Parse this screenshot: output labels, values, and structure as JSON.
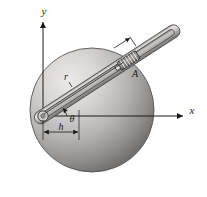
{
  "figure": {
    "background_color": "#ffffff",
    "line_color": "#1a1a1a"
  },
  "axes": {
    "y_label": "y",
    "x_label": "x",
    "origin_x": 43,
    "origin_y": 116,
    "y_tip_x": 43,
    "y_tip_y": 18,
    "x_tip_x": 187,
    "x_tip_y": 116
  },
  "disk": {
    "name": "shaded-disk",
    "center_x": 92,
    "center_y": 110,
    "radius": 62,
    "fill_light": "#e3e2e0",
    "fill_mid": "#b9b8b6",
    "fill_dark": "#6e6d6b",
    "edge_color": "#5a5a58"
  },
  "rod": {
    "name": "slotted-rod",
    "pivot_x": 43,
    "pivot_y": 116,
    "tip_x": 176,
    "tip_y": 30,
    "angle_deg": 33,
    "half_width": 6,
    "body_light": "#dedddb",
    "body_mid": "#b4b3b1",
    "body_dark": "#7f7e7c",
    "slot_fill": "#cfcecc"
  },
  "slider": {
    "name": "slider-block-A",
    "label": "A",
    "label_x": 134,
    "label_y": 75,
    "center_x": 126,
    "center_y": 60,
    "coil_count": 6,
    "fill": "#8e8d8b"
  },
  "dimensions": {
    "r": {
      "label": "r",
      "label_x": 70,
      "label_y": 80,
      "leader_from_x": 43,
      "leader_from_y": 116,
      "leader_to_x": 122,
      "leader_to_y": 64
    },
    "h": {
      "label": "h",
      "label_x": 62,
      "label_y": 135,
      "left_x": 43,
      "right_x": 78,
      "y": 131
    },
    "theta": {
      "label": "θ",
      "label_x": 72,
      "label_y": 121,
      "arc_radius": 24
    },
    "tick_arrow": {
      "name": "slider-position-arrow",
      "from_x": 115,
      "from_y": 47,
      "to_x": 131,
      "to_y": 38
    }
  }
}
